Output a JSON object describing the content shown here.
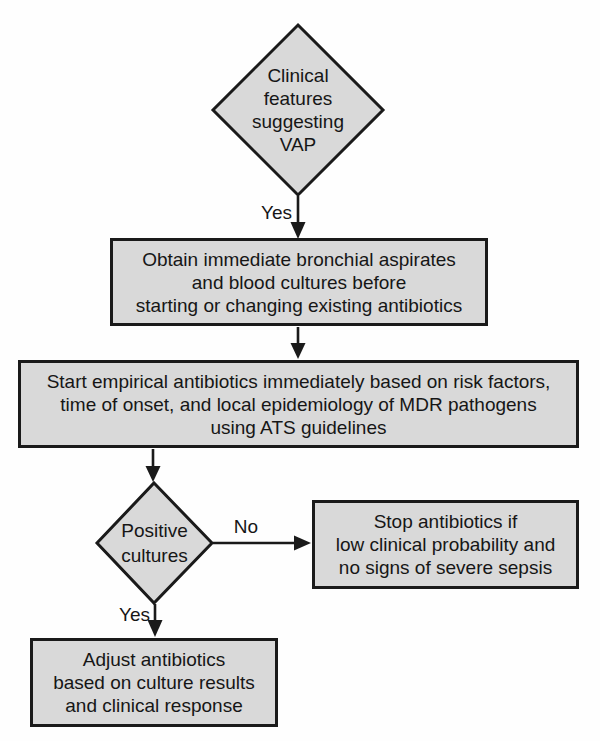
{
  "colors": {
    "background": "#fefefe",
    "node_fill": "#d9d9d9",
    "node_border": "#1a1a1a",
    "text": "#161616"
  },
  "nodes": {
    "diamond_vap": {
      "lines": [
        "Clinical",
        "features",
        "suggesting",
        "VAP"
      ]
    },
    "box_obtain": {
      "lines": [
        "Obtain immediate bronchial aspirates",
        "and blood cultures before",
        "starting or changing existing antibiotics"
      ]
    },
    "box_start": {
      "lines": [
        "Start empirical antibiotics immediately based on risk factors,",
        "time of onset, and local epidemiology of MDR pathogens",
        "using ATS guidelines"
      ]
    },
    "diamond_cultures": {
      "lines": [
        "Positive",
        "cultures"
      ]
    },
    "box_stop": {
      "lines": [
        "Stop antibiotics if",
        "low clinical probability and",
        "no signs of severe sepsis"
      ]
    },
    "box_adjust": {
      "lines": [
        "Adjust antibiotics",
        "based on culture results",
        "and clinical response"
      ]
    }
  },
  "edge_labels": {
    "yes_top": "Yes",
    "no_right": "No",
    "yes_bottom": "Yes"
  }
}
